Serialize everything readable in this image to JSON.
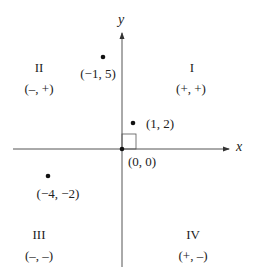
{
  "axes": {
    "x_label": "x",
    "y_label": "y"
  },
  "origin": {
    "label": "(0, 0)"
  },
  "quadrants": [
    {
      "numeral": "I",
      "signs": "(+, +)"
    },
    {
      "numeral": "II",
      "signs": "(–, +)"
    },
    {
      "numeral": "III",
      "signs": "(–, –)"
    },
    {
      "numeral": "IV",
      "signs": "(+, –)"
    }
  ],
  "points": [
    {
      "label": "(−1, 5)",
      "x": -1,
      "y": 5
    },
    {
      "label": "(1, 2)",
      "x": 1,
      "y": 2
    },
    {
      "label": "(−4, −2)",
      "x": -4,
      "y": -2
    }
  ],
  "colors": {
    "ink": "#222222",
    "axis": "#555555"
  }
}
